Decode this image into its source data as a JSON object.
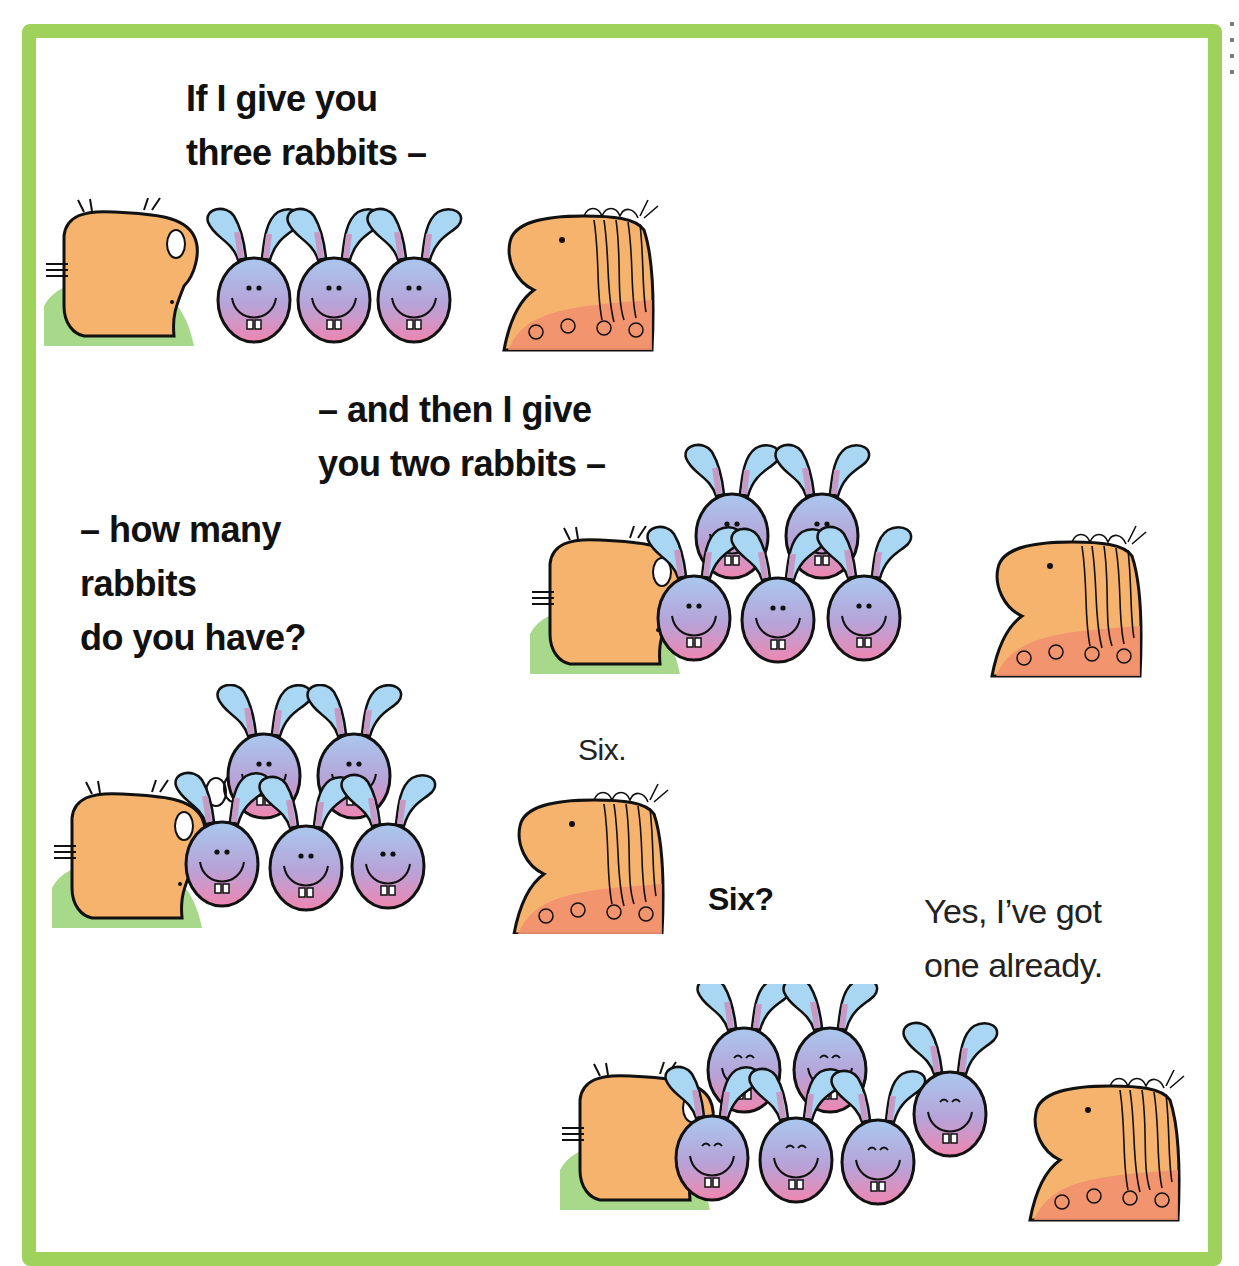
{
  "page": {
    "border_color": "#9ed25a",
    "background": "#ffffff"
  },
  "colors": {
    "skin": "#f6b36e",
    "skin_shadow": "#f09a5a",
    "sweater": "#a8d88a",
    "dress": "#f2906e",
    "rabbit_top": "#a9c8ee",
    "rabbit_bottom": "#ef86b0",
    "ear": "#a9d6f2",
    "outline": "#111111"
  },
  "captions": {
    "line1": "If I give you\nthree rabbits –",
    "line2": "– and then I give\nyou two rabbits –",
    "line3": "– how many\nrabbits\ndo you have?",
    "answer_six": "Six.",
    "question_six": "Six?",
    "reply": "Yes, I’ve got\none already."
  },
  "scenes": [
    {
      "name": "three-rabbits",
      "rabbit_count": 3
    },
    {
      "name": "plus-two-rabbits",
      "rabbit_count": 5
    },
    {
      "name": "counting-six",
      "rabbit_count": 5
    },
    {
      "name": "one-already",
      "rabbit_count": 6
    }
  ]
}
